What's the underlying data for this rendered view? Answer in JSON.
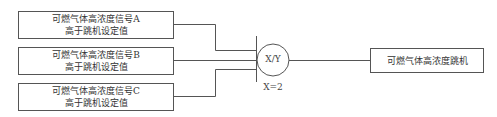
{
  "inputs": [
    {
      "line1": "可燃气体高浓度信号A",
      "line2": "高于跳机设定值"
    },
    {
      "line1": "可燃气体高浓度信号B",
      "line2": "高于跳机设定值"
    },
    {
      "line1": "可燃气体高浓度信号C",
      "line2": "高于跳机设定值"
    }
  ],
  "voter": {
    "symbol": "X/Y",
    "condition": "X=2"
  },
  "output": {
    "label": "可燃气体高浓度跳机"
  },
  "colors": {
    "line": "#555555",
    "background": "#ffffff"
  }
}
